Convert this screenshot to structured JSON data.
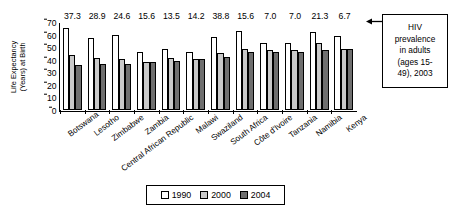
{
  "chart_data": {
    "type": "bar",
    "title": "",
    "xlabel": "",
    "ylabel": "Life Expectancy (Years) at Birth",
    "ylabel_line1": "Life Expectancy",
    "ylabel_line2": "(Years) at Birth",
    "ylim": [
      0,
      70
    ],
    "yticks": [
      70,
      60,
      50,
      40,
      30,
      20,
      10,
      0
    ],
    "grid": false,
    "legend_position": "bottom",
    "categories": [
      "Botswana",
      "Lesotho",
      "Zimbabwe",
      "Zambia",
      "Central African Republic",
      "Malawi",
      "Swaziland",
      "South Africa",
      "Côte d'Ivoire",
      "Tanzania",
      "Namibia",
      "Kenya"
    ],
    "series": [
      {
        "name": "1990",
        "color": "#ffffff",
        "values": [
          65.0,
          57.5,
          60.0,
          46.5,
          48.5,
          46.5,
          58.0,
          62.5,
          53.0,
          53.5,
          62.0,
          59.0
        ]
      },
      {
        "name": "2000",
        "color": "#c9c9c9",
        "values": [
          44.0,
          41.5,
          40.5,
          38.5,
          41.5,
          40.5,
          45.5,
          48.5,
          47.5,
          48.0,
          53.0,
          48.5
        ]
      },
      {
        "name": "2004",
        "color": "#6f6f6f",
        "values": [
          35.5,
          37.0,
          37.0,
          38.5,
          39.0,
          40.5,
          42.5,
          46.0,
          46.5,
          46.5,
          47.5,
          48.5
        ]
      }
    ],
    "annotations": {
      "top_values_label": "HIV prevalence in adults (ages 15-49), 2003",
      "top_values": [
        "37.3",
        "28.9",
        "24.6",
        "15.6",
        "13.5",
        "14.2",
        "38.8",
        "15.6",
        "7.0",
        "7.0",
        "21.3",
        "6.7"
      ]
    }
  },
  "callout": {
    "line1": "HIV",
    "line2": "prevalence",
    "line3": "in adults",
    "line4": "(ages 15-",
    "line5": "49), 2003"
  },
  "legend": {
    "items": [
      {
        "label": "1990"
      },
      {
        "label": "2000"
      },
      {
        "label": "2004"
      }
    ]
  }
}
